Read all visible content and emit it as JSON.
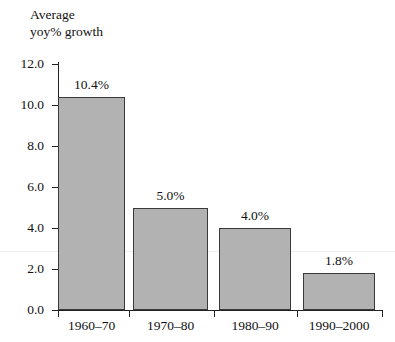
{
  "chart_data": {
    "type": "bar",
    "title": "Average\nyoy% growth",
    "xlabel": "",
    "ylabel": "",
    "categories": [
      "1960–70",
      "1970–80",
      "1980–90",
      "1990–2000"
    ],
    "values": [
      10.4,
      5.0,
      4.0,
      1.8
    ],
    "data_labels": [
      "10.4%",
      "5.0%",
      "4.0%",
      "1.8%"
    ],
    "ylim": [
      0.0,
      12.0
    ],
    "ytick_values": [
      0.0,
      2.0,
      4.0,
      6.0,
      8.0,
      10.0,
      12.0
    ],
    "ytick_labels": [
      "0.0",
      "2.0",
      "4.0",
      "6.0",
      "8.0",
      "10.0",
      "12.0"
    ],
    "grid": false,
    "legend": null,
    "colors": {
      "bar_fill": "#b2b2b2",
      "bar_border": "#3a3a3a",
      "axis": "#222222",
      "text": "#111111",
      "background": "#ffffff"
    }
  }
}
